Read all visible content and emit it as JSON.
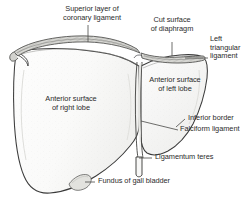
{
  "figure": {
    "view": "anterior",
    "background_color": "#ffffff",
    "outline_color": "#3a3a3a",
    "fill_color": "#fbfbfb",
    "shade_color": "#e8e8e6",
    "text_color": "#2b2b2b"
  },
  "labels": {
    "superior_layer_coronary_ligament": {
      "line1": "Superior layer of",
      "line2": "coronary ligament"
    },
    "cut_surface_diaphragm": {
      "line1": "Cut surface",
      "line2": "of diaphragm"
    },
    "left_triangular_ligament": {
      "line1": "Left",
      "line2": "triangular",
      "line3": "ligament"
    },
    "anterior_surface_left_lobe": {
      "line1": "Anterior surface",
      "line2": "of left lobe"
    },
    "anterior_surface_right_lobe": {
      "line1": "Anterior surface",
      "line2": "of right lobe"
    },
    "inferior_border": {
      "line1": "Inferior border"
    },
    "falciform_ligament": {
      "line1": "Falciform ligament"
    },
    "ligamentum_teres": {
      "line1": "Ligamentum teres"
    },
    "fundus_of_gall_bladder": {
      "line1": "Fundus of gall bladder"
    }
  }
}
